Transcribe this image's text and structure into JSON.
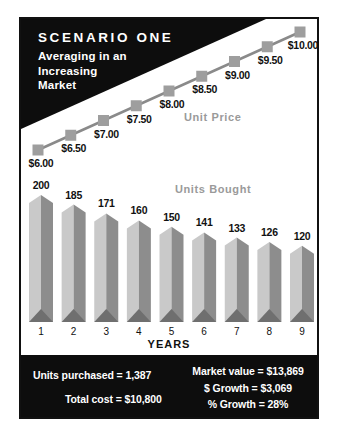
{
  "header": {
    "title": "SCENARIO ONE",
    "subtitle_lines": [
      "Averaging in an",
      "Increasing",
      "Market"
    ]
  },
  "chart_data": [
    {
      "type": "line",
      "name": "unit-price",
      "label": "Unit Price",
      "x": [
        1,
        2,
        3,
        4,
        5,
        6,
        7,
        8,
        9
      ],
      "values": [
        6.0,
        6.5,
        7.0,
        7.5,
        8.0,
        8.5,
        9.0,
        9.5,
        10.0
      ],
      "point_labels": [
        "$6.00",
        "$6.50",
        "$7.00",
        "$7.50",
        "$8.00",
        "$8.50",
        "$9.00",
        "$9.50",
        "$10.00"
      ],
      "marker": "square",
      "ylim": [
        6,
        10
      ],
      "grid": false,
      "legend_position": "inline-right"
    },
    {
      "type": "bar",
      "name": "units-bought",
      "label": "Units Bought",
      "categories": [
        "1",
        "2",
        "3",
        "4",
        "5",
        "6",
        "7",
        "8",
        "9"
      ],
      "values": [
        200,
        185,
        171,
        160,
        150,
        141,
        133,
        126,
        120
      ],
      "xlabel": "YEARS",
      "ylim": [
        0,
        210
      ],
      "grid": false,
      "bar_style": "3d-obelisk"
    }
  ],
  "footer": {
    "units_purchased": "Units purchased = 1,387",
    "total_cost": "Total cost = $10,800",
    "market_value": "Market value = $13,869",
    "dollar_growth": "$ Growth = $3,069",
    "pct_growth": "% Growth = 28%"
  },
  "colors": {
    "black": "#0d0d0d",
    "line": "#8a8a8a",
    "marker": "#9e9e9e",
    "bar_left_face": "#c9c9c9",
    "bar_right_face": "#8d8d8d",
    "bar_base": "#6f6f6f",
    "muted_label": "#9a9a9a",
    "text": "#111111"
  }
}
